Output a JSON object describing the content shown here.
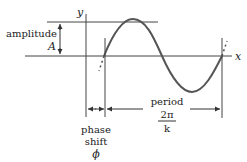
{
  "diagram": {
    "axes": {
      "x_label": "x",
      "y_label": "y"
    },
    "labels": {
      "amplitude_word": "amplitude",
      "amplitude_symbol": "A",
      "period_word": "period",
      "period_numerator": "2π",
      "period_denominator": "k",
      "phase_word_1": "phase",
      "phase_word_2": "shift",
      "phase_symbol": "ϕ"
    },
    "colors": {
      "curve": "#555555",
      "lines": "#444444",
      "text": "#222222"
    }
  }
}
